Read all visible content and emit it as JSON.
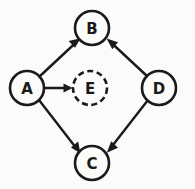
{
  "diagram": {
    "type": "directed-graph",
    "background_color": "#fbfbfa",
    "stroke_color": "#1a1a1a",
    "canvas": {
      "width": 195,
      "height": 189
    },
    "nodes": [
      {
        "id": "A",
        "label": "A",
        "cx": 27,
        "cy": 88,
        "r": 17,
        "border": "solid",
        "name": "node-a"
      },
      {
        "id": "B",
        "label": "B",
        "cx": 92,
        "cy": 28,
        "r": 17,
        "border": "solid",
        "name": "node-b"
      },
      {
        "id": "E",
        "label": "E",
        "cx": 90,
        "cy": 88,
        "r": 17,
        "border": "dashed",
        "name": "node-e"
      },
      {
        "id": "D",
        "label": "D",
        "cx": 159,
        "cy": 88,
        "r": 17,
        "border": "solid",
        "name": "node-d"
      },
      {
        "id": "C",
        "label": "C",
        "cx": 92,
        "cy": 163,
        "r": 17,
        "border": "solid",
        "name": "node-c"
      }
    ],
    "edges": [
      {
        "id": "A-B",
        "from": "A",
        "to": "B",
        "directed": true,
        "name": "edge-a-to-b"
      },
      {
        "id": "A-E",
        "from": "A",
        "to": "E",
        "directed": true,
        "name": "edge-a-to-e"
      },
      {
        "id": "A-C",
        "from": "A",
        "to": "C",
        "directed": true,
        "name": "edge-a-to-c"
      },
      {
        "id": "D-B",
        "from": "D",
        "to": "B",
        "directed": true,
        "name": "edge-d-to-b"
      },
      {
        "id": "D-C",
        "from": "D",
        "to": "C",
        "directed": true,
        "name": "edge-d-to-c"
      }
    ]
  }
}
